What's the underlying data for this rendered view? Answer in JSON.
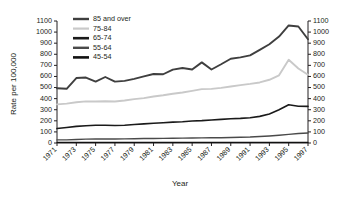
{
  "chart_data": {
    "type": "line",
    "title": "",
    "xlabel": "Year",
    "ylabel": "Rate per 100,000",
    "y2label": "",
    "grid": false,
    "legend_position": "top-left-inside",
    "xlim": [
      1971,
      1997
    ],
    "ylim": [
      0,
      1100
    ],
    "y_ticks": [
      0,
      100,
      200,
      300,
      400,
      500,
      600,
      700,
      800,
      900,
      1000,
      1100
    ],
    "y2_ticks": [
      0,
      100,
      200,
      300,
      400,
      500,
      600,
      700,
      800,
      900,
      1000,
      1100
    ],
    "x_tick_labels": [
      "1971",
      "1973",
      "1975",
      "1977",
      "1979",
      "1981",
      "1983",
      "1985",
      "1987",
      "1989",
      "1991",
      "1993",
      "1995",
      "1997"
    ],
    "x": [
      1971,
      1972,
      1973,
      1974,
      1975,
      1976,
      1977,
      1978,
      1979,
      1980,
      1981,
      1982,
      1983,
      1984,
      1985,
      1986,
      1987,
      1988,
      1989,
      1990,
      1991,
      1992,
      1993,
      1994,
      1995,
      1996,
      1997
    ],
    "series": [
      {
        "name": "85 and over",
        "color": "#3f3f3f",
        "width": 1.9,
        "values": [
          494,
          489,
          586,
          590,
          553,
          595,
          553,
          560,
          578,
          600,
          622,
          620,
          662,
          676,
          663,
          727,
          663,
          710,
          760,
          772,
          790,
          840,
          890,
          960,
          1060,
          1050,
          935
        ]
      },
      {
        "name": "75-84",
        "color": "#c9c9c9",
        "width": 1.9,
        "values": [
          348,
          355,
          367,
          375,
          374,
          376,
          374,
          383,
          396,
          405,
          419,
          430,
          444,
          455,
          470,
          486,
          488,
          497,
          510,
          522,
          533,
          546,
          570,
          610,
          750,
          672,
          615
        ]
      },
      {
        "name": "65-74",
        "color": "#1a1a1a",
        "width": 1.6,
        "values": [
          130,
          140,
          150,
          156,
          160,
          160,
          158,
          160,
          167,
          172,
          178,
          182,
          188,
          192,
          198,
          202,
          208,
          213,
          218,
          222,
          228,
          240,
          262,
          300,
          345,
          332,
          330
        ]
      },
      {
        "name": "55-64",
        "color": "#4a4a4a",
        "width": 1.4,
        "values": [
          28,
          28,
          32,
          35,
          36,
          36,
          36,
          37,
          38,
          40,
          41,
          42,
          43,
          44,
          45,
          46,
          47,
          48,
          50,
          52,
          54,
          58,
          63,
          70,
          78,
          86,
          90
        ]
      },
      {
        "name": "45-54",
        "color": "#111111",
        "width": 1.2,
        "values": [
          6,
          6,
          6,
          6,
          6,
          6,
          6,
          6,
          6,
          6,
          6,
          6,
          6,
          6,
          6,
          6,
          6,
          6,
          6,
          6,
          6,
          6,
          6,
          6,
          6,
          6,
          6
        ]
      }
    ],
    "legend": [
      {
        "label": "85 and over",
        "color": "#3f3f3f",
        "width": 2.4
      },
      {
        "label": "75-84",
        "color": "#c9c9c9",
        "width": 2.2
      },
      {
        "label": "65-74",
        "color": "#1a1a1a",
        "width": 2.6
      },
      {
        "label": "55-64",
        "color": "#4a4a4a",
        "width": 2.4
      },
      {
        "label": "45-54",
        "color": "#111111",
        "width": 2.6
      }
    ]
  }
}
